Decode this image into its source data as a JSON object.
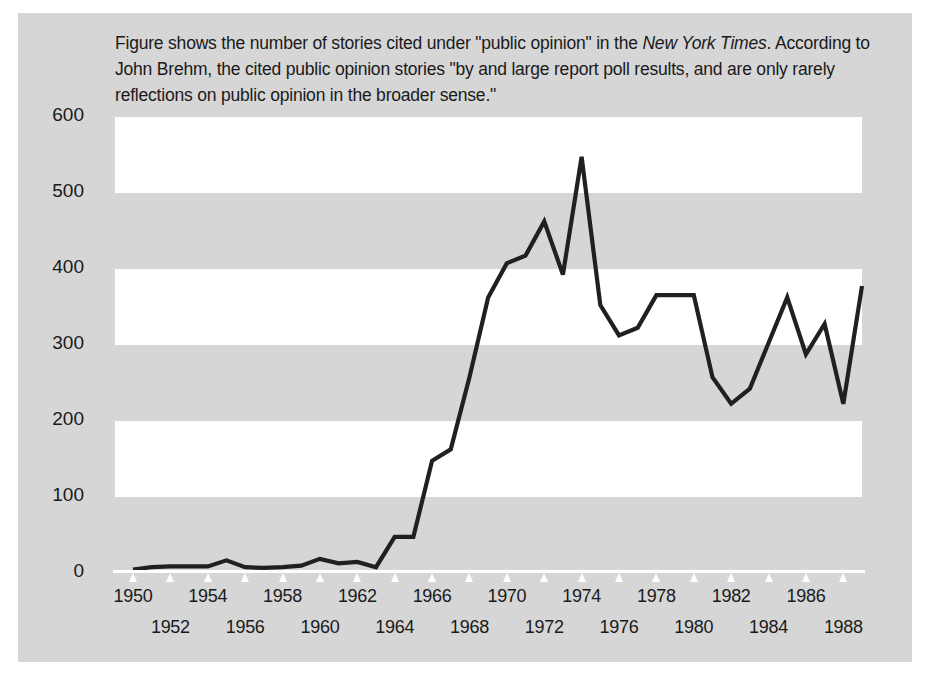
{
  "caption": {
    "line1_a": "Figure shows the number of stories cited under \"public opinion\" in the ",
    "line1_italic": "New York Times",
    "line1_b": ".",
    "line2": "According to John Brehm, the cited public opinion stories \"by and large report poll results,",
    "line3": "and are only rarely reflections on public opinion in the broader sense.\""
  },
  "colors": {
    "panel_background": "#d6d6d6",
    "band_white": "#ffffff",
    "line": "#231f20",
    "text": "#1a1a1a",
    "axis": "#ffffff"
  },
  "chart_data": {
    "type": "line",
    "title": "",
    "xlabel": "",
    "ylabel": "",
    "xlim": [
      1950,
      1989
    ],
    "ylim": [
      0,
      600
    ],
    "grid": "horizontal-alternating-bands",
    "legend": "none",
    "ytick_labels": [
      "600",
      "500",
      "400",
      "300",
      "200",
      "100",
      "0"
    ],
    "ytick_values": [
      600,
      500,
      400,
      300,
      200,
      100,
      0
    ],
    "xtick_labels_row1": [
      "1950",
      "1954",
      "1958",
      "1962",
      "1966",
      "1970",
      "1974",
      "1978",
      "1982",
      "1986"
    ],
    "xtick_labels_row2": [
      "1952",
      "1956",
      "1960",
      "1964",
      "1968",
      "1972",
      "1976",
      "1980",
      "1984",
      "1988"
    ],
    "xtick_values": [
      1950,
      1952,
      1954,
      1956,
      1958,
      1960,
      1962,
      1964,
      1966,
      1968,
      1970,
      1972,
      1974,
      1976,
      1978,
      1980,
      1982,
      1984,
      1986,
      1988
    ],
    "x": [
      1950,
      1951,
      1952,
      1953,
      1954,
      1955,
      1956,
      1957,
      1958,
      1959,
      1960,
      1961,
      1962,
      1963,
      1964,
      1965,
      1966,
      1967,
      1968,
      1969,
      1970,
      1971,
      1972,
      1973,
      1974,
      1975,
      1976,
      1977,
      1978,
      1979,
      1980,
      1981,
      1982,
      1983,
      1984,
      1985,
      1986,
      1987,
      1988,
      1989
    ],
    "values": [
      2,
      5,
      6,
      6,
      6,
      14,
      5,
      4,
      5,
      7,
      16,
      10,
      12,
      5,
      45,
      45,
      145,
      160,
      255,
      360,
      405,
      415,
      460,
      390,
      545,
      350,
      310,
      320,
      363,
      363,
      363,
      255,
      220,
      240,
      300,
      360,
      285,
      325,
      220,
      375
    ]
  }
}
